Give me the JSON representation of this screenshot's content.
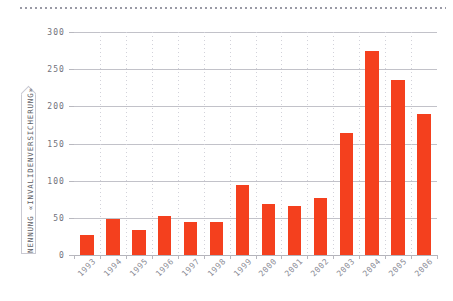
{
  "chart_data": {
    "type": "bar",
    "title": "",
    "subtitle": "",
    "xlabel": "",
    "ylabel": "NENNUNG «INVALIDENVERSICHERUNG»",
    "categories": [
      "1993",
      "1994",
      "1995",
      "1996",
      "1997",
      "1998",
      "1999",
      "2000",
      "2001",
      "2002",
      "2003",
      "2004",
      "2005",
      "2006"
    ],
    "values": [
      27,
      48,
      33,
      53,
      45,
      45,
      94,
      69,
      66,
      77,
      164,
      275,
      236,
      190
    ],
    "series": [
      {
        "name": "Nennung «Invalidenversicherung»",
        "values": [
          27,
          48,
          33,
          53,
          45,
          45,
          94,
          69,
          66,
          77,
          164,
          275,
          236,
          190
        ]
      }
    ],
    "ylim": [
      0,
      300
    ],
    "yticks": [
      0,
      50,
      100,
      150,
      200,
      250,
      300
    ],
    "ytick_labels": [
      "0",
      "50",
      "100",
      "150",
      "200",
      "250",
      "300"
    ],
    "xtick_labels": [
      "1993",
      "1994",
      "1995",
      "1996",
      "1997",
      "1998",
      "1999",
      "2000",
      "2001",
      "2002",
      "2003",
      "2004",
      "2005",
      "2006"
    ],
    "grid": true,
    "grid_horizontal": true,
    "grid_vertical": true,
    "legend": false,
    "legend_position": "none",
    "bar_color": "#f4401e",
    "grid_color": "#c2c2c9",
    "axis_text_color": "#71717b",
    "background_color": "#ffffff",
    "xtick_rotation": -45
  },
  "decoration": {
    "top_rule_style": "dotted",
    "top_rule_color": "#9a9aa6",
    "ylabel_banner_border": "#c9c9d2"
  }
}
